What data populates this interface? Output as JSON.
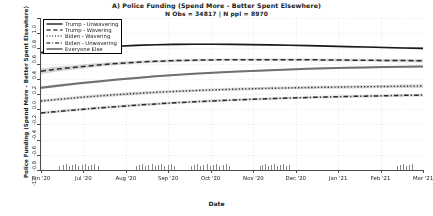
{
  "chart_data": {
    "type": "line",
    "title": "A) Police Funding (Spend More - Better Spent Elsewhere)",
    "subtitle": "N Obs = 34817 | N ppl = 8970",
    "xlabel": "Date",
    "ylabel": "Police Funding (Spend More - Better Spent Elsewhere)",
    "ylim": [
      -1.0,
      1.0
    ],
    "yticks": [
      "1.0",
      "0.8",
      "0.6",
      "0.4",
      "0.2",
      "0.0",
      "-0.2",
      "-0.4",
      "-0.6",
      "-0.8",
      "-1.0"
    ],
    "ytick_values": [
      1.0,
      0.8,
      0.6,
      0.4,
      0.2,
      0.0,
      -0.2,
      -0.4,
      -0.6,
      -0.8,
      -1.0
    ],
    "xticks": [
      "Jun '20",
      "Jul '20",
      "Aug '20",
      "Sep '20",
      "Oct '20",
      "Nov '20",
      "Dec '20",
      "Jan '21",
      "Feb '21",
      "Mar '21"
    ],
    "xtick_positions": [
      0.0,
      0.111,
      0.222,
      0.333,
      0.444,
      0.556,
      0.667,
      0.778,
      0.889,
      1.0
    ],
    "grid": true,
    "grid_style": "dotted",
    "legend_position": "top-left",
    "x": [
      0.0,
      0.05,
      0.1,
      0.15,
      0.2,
      0.25,
      0.3,
      0.35,
      0.4,
      0.45,
      0.5,
      0.55,
      0.6,
      0.65,
      0.7,
      0.75,
      0.8,
      0.85,
      0.9,
      0.95,
      1.0
    ],
    "series": [
      {
        "name": "Trump - Unwavering",
        "style": "solid",
        "color": "#1a1a1a",
        "width": 1.6,
        "values": [
          0.545,
          0.57,
          0.592,
          0.612,
          0.628,
          0.64,
          0.648,
          0.653,
          0.655,
          0.655,
          0.653,
          0.65,
          0.646,
          0.641,
          0.636,
          0.63,
          0.624,
          0.618,
          0.612,
          0.606,
          0.6
        ],
        "band_lo": [
          0.52,
          0.549,
          0.574,
          0.596,
          0.614,
          0.628,
          0.637,
          0.643,
          0.646,
          0.646,
          0.645,
          0.642,
          0.638,
          0.633,
          0.628,
          0.622,
          0.615,
          0.608,
          0.601,
          0.593,
          0.585
        ],
        "band_hi": [
          0.57,
          0.591,
          0.61,
          0.628,
          0.642,
          0.652,
          0.659,
          0.663,
          0.664,
          0.664,
          0.661,
          0.658,
          0.654,
          0.649,
          0.644,
          0.638,
          0.633,
          0.628,
          0.623,
          0.619,
          0.615
        ]
      },
      {
        "name": "Trump - Wavering",
        "style": "dashed",
        "color": "#2b2b2b",
        "width": 1.5,
        "values": [
          0.3,
          0.331,
          0.358,
          0.382,
          0.402,
          0.418,
          0.43,
          0.439,
          0.445,
          0.449,
          0.451,
          0.452,
          0.452,
          0.451,
          0.45,
          0.448,
          0.446,
          0.444,
          0.442,
          0.44,
          0.438
        ],
        "band_lo": [
          0.262,
          0.298,
          0.33,
          0.357,
          0.38,
          0.398,
          0.412,
          0.422,
          0.429,
          0.433,
          0.436,
          0.437,
          0.437,
          0.436,
          0.434,
          0.432,
          0.429,
          0.426,
          0.422,
          0.418,
          0.414
        ],
        "band_hi": [
          0.338,
          0.364,
          0.386,
          0.407,
          0.424,
          0.438,
          0.448,
          0.456,
          0.461,
          0.465,
          0.466,
          0.467,
          0.467,
          0.466,
          0.466,
          0.464,
          0.463,
          0.462,
          0.462,
          0.462,
          0.462
        ]
      },
      {
        "name": "Everyone Else",
        "style": "solid-thick-gray",
        "color": "#707070",
        "width": 2.0,
        "values": [
          0.082,
          0.112,
          0.14,
          0.166,
          0.19,
          0.212,
          0.232,
          0.25,
          0.266,
          0.28,
          0.293,
          0.304,
          0.314,
          0.323,
          0.331,
          0.338,
          0.344,
          0.35,
          0.355,
          0.359,
          0.363
        ],
        "band_lo": [
          0.062,
          0.094,
          0.124,
          0.151,
          0.176,
          0.199,
          0.22,
          0.239,
          0.255,
          0.27,
          0.283,
          0.294,
          0.304,
          0.313,
          0.321,
          0.328,
          0.334,
          0.339,
          0.344,
          0.348,
          0.351
        ],
        "band_hi": [
          0.102,
          0.13,
          0.156,
          0.181,
          0.204,
          0.225,
          0.244,
          0.261,
          0.277,
          0.29,
          0.303,
          0.314,
          0.324,
          0.333,
          0.341,
          0.348,
          0.354,
          0.361,
          0.366,
          0.37,
          0.375
        ]
      },
      {
        "name": "Biden - Wavering",
        "style": "dotted",
        "color": "#333333",
        "width": 1.4,
        "values": [
          -0.092,
          -0.068,
          -0.046,
          -0.026,
          -0.008,
          0.008,
          0.022,
          0.034,
          0.045,
          0.054,
          0.062,
          0.069,
          0.075,
          0.08,
          0.085,
          0.089,
          0.093,
          0.096,
          0.099,
          0.102,
          0.105
        ],
        "band_lo": [
          -0.112,
          -0.088,
          -0.066,
          -0.046,
          -0.028,
          -0.012,
          0.002,
          0.015,
          0.026,
          0.035,
          0.043,
          0.05,
          0.056,
          0.061,
          0.066,
          0.07,
          0.073,
          0.076,
          0.078,
          0.08,
          0.082
        ],
        "band_hi": [
          -0.072,
          -0.048,
          -0.026,
          -0.006,
          0.012,
          0.028,
          0.042,
          0.053,
          0.064,
          0.073,
          0.081,
          0.088,
          0.094,
          0.099,
          0.104,
          0.108,
          0.113,
          0.116,
          0.12,
          0.124,
          0.128
        ]
      },
      {
        "name": "Biden - Unwavering",
        "style": "dashdot",
        "color": "#2b2b2b",
        "width": 1.5,
        "values": [
          -0.25,
          -0.227,
          -0.205,
          -0.184,
          -0.165,
          -0.147,
          -0.131,
          -0.116,
          -0.103,
          -0.091,
          -0.08,
          -0.07,
          -0.061,
          -0.053,
          -0.046,
          -0.039,
          -0.033,
          -0.028,
          -0.023,
          -0.018,
          -0.014
        ],
        "band_lo": [
          -0.268,
          -0.245,
          -0.223,
          -0.202,
          -0.183,
          -0.165,
          -0.148,
          -0.133,
          -0.12,
          -0.108,
          -0.097,
          -0.087,
          -0.078,
          -0.07,
          -0.063,
          -0.056,
          -0.05,
          -0.045,
          -0.04,
          -0.036,
          -0.032
        ],
        "band_hi": [
          -0.232,
          -0.209,
          -0.187,
          -0.166,
          -0.147,
          -0.129,
          -0.114,
          -0.099,
          -0.086,
          -0.074,
          -0.063,
          -0.053,
          -0.044,
          -0.036,
          -0.029,
          -0.022,
          -0.016,
          -0.011,
          -0.006,
          0.0,
          0.004
        ]
      }
    ],
    "rug": {
      "color": "#8a8a8a",
      "clusters": [
        {
          "start": 0.048,
          "end": 0.148
        },
        {
          "start": 0.248,
          "end": 0.348
        },
        {
          "start": 0.392,
          "end": 0.492
        },
        {
          "start": 0.572,
          "end": 0.65
        },
        {
          "start": 0.932,
          "end": 0.972
        }
      ]
    }
  },
  "legend": {
    "items": [
      {
        "label": "Trump - Unwavering",
        "style": "solid"
      },
      {
        "label": "Trump - Wavering",
        "style": "dashed"
      },
      {
        "label": "Biden - Wavering",
        "style": "dotted"
      },
      {
        "label": "Biden - Unwavering",
        "style": "dashdot"
      },
      {
        "label": "Everyone Else",
        "style": "solid-thick-gray"
      }
    ]
  }
}
